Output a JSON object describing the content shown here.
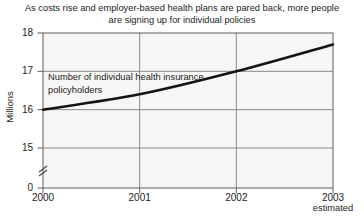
{
  "title": {
    "line1": "As costs rise and employer-based health plans are pared back, more people",
    "line2": "are signing up for individual policies"
  },
  "annotation": {
    "line1": "Number of individual health insurance",
    "line2": "policyholders"
  },
  "colors": {
    "line": "#141414",
    "grid": "#8a8a8a",
    "border": "#5f5f5f",
    "plot_bg": "#f7f6f4",
    "text": "#1c1c1c"
  },
  "chart_data": {
    "type": "line",
    "title": "As costs rise and employer-based health plans are pared back, more people are signing up for individual policies",
    "series_label": "Number of individual health insurance policyholders",
    "x": [
      2000,
      2001,
      2002,
      2003
    ],
    "values": [
      16.0,
      16.4,
      17.0,
      17.7
    ],
    "xlabel": "",
    "ylabel": "Millions",
    "x_tick_labels": [
      "2000",
      "2001",
      "2002",
      "2003"
    ],
    "x_footnote": "estimated",
    "y_tick_labels": [
      "18",
      "17",
      "16",
      "15",
      "0"
    ],
    "y_tick_values": [
      18,
      17,
      16,
      15,
      0
    ],
    "ylim": [
      15,
      18
    ],
    "axis_break": true,
    "grid": true,
    "legend_position": "none"
  }
}
